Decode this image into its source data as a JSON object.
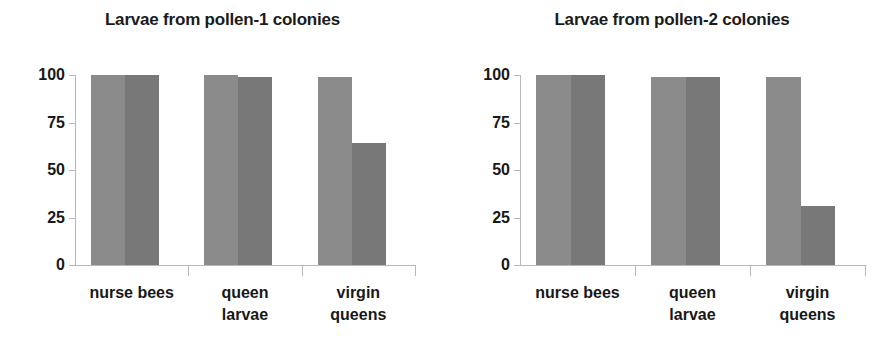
{
  "chart_data": [
    {
      "type": "bar",
      "title": "Larvae from pollen-1 colonies",
      "xlabel": "",
      "ylabel": "",
      "ylim": [
        0,
        100
      ],
      "yticks": [
        "0",
        "25",
        "50",
        "75",
        "100"
      ],
      "grid": false,
      "legend": "none",
      "categories": [
        "nurse bees",
        "queen larvae",
        "virgin queens"
      ],
      "category_lines": [
        [
          "nurse bees"
        ],
        [
          "queen",
          "larvae"
        ],
        [
          "virgin",
          "queens"
        ]
      ],
      "series": [
        {
          "name": "light-series",
          "color": "#8b8b8b",
          "values": [
            100,
            100,
            99
          ]
        },
        {
          "name": "dark-series",
          "color": "#787878",
          "values": [
            100,
            99,
            64
          ]
        }
      ]
    },
    {
      "type": "bar",
      "title": "Larvae from pollen-2 colonies",
      "xlabel": "",
      "ylabel": "",
      "ylim": [
        0,
        100
      ],
      "yticks": [
        "0",
        "25",
        "50",
        "75",
        "100"
      ],
      "grid": false,
      "legend": "none",
      "categories": [
        "nurse bees",
        "queen larvae",
        "virgin queens"
      ],
      "category_lines": [
        [
          "nurse bees"
        ],
        [
          "queen",
          "larvae"
        ],
        [
          "virgin",
          "queens"
        ]
      ],
      "series": [
        {
          "name": "light-series",
          "color": "#8b8b8b",
          "values": [
            100,
            99,
            99
          ]
        },
        {
          "name": "dark-series",
          "color": "#787878",
          "values": [
            100,
            99,
            31
          ]
        }
      ]
    }
  ],
  "figure": {
    "background": "#ffffff",
    "axis_color": "#b8b8b8",
    "text_color": "#181818"
  }
}
